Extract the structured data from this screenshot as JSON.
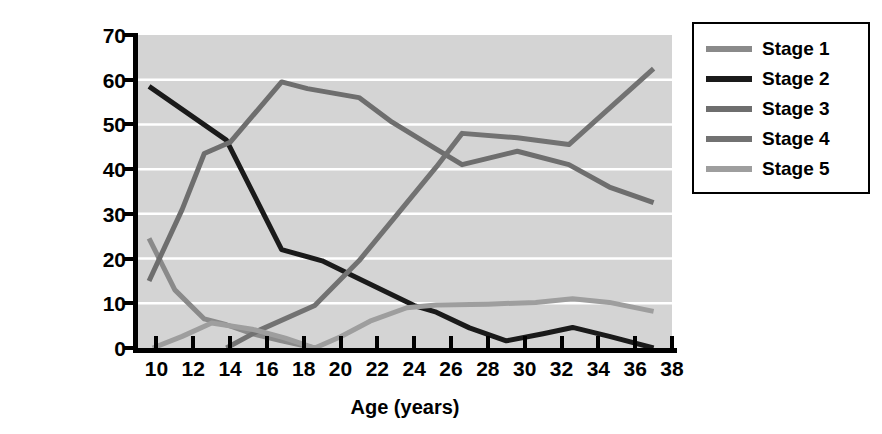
{
  "chart_data": {
    "type": "line",
    "title": "",
    "xlabel": "Age (years)",
    "ylabel_line1": "Percentage at each stage",
    "ylabel_line2": "of moral reasoning",
    "xlim": [
      9,
      38
    ],
    "ylim": [
      0,
      70
    ],
    "xticks": [
      10,
      12,
      14,
      16,
      18,
      20,
      22,
      24,
      26,
      28,
      30,
      32,
      34,
      36,
      38
    ],
    "yticks": [
      0,
      10,
      20,
      30,
      40,
      50,
      60,
      70
    ],
    "grid": "horizontal",
    "gridcolor": "#ffffff",
    "plot_background": "#d4d4d4",
    "legend_position": "right-outside",
    "series": [
      {
        "name": "Stage 1",
        "color": "#8a8a8a",
        "x": [
          9.6,
          11.0,
          12.6,
          13.8,
          15.2,
          16.8,
          18.6
        ],
        "values": [
          24.5,
          13.0,
          6.5,
          5.2,
          3.2,
          1.6,
          0.0
        ]
      },
      {
        "name": "Stage 2",
        "color": "#1a1a1a",
        "x": [
          9.6,
          13.8,
          16.8,
          19.0,
          21.0,
          24.0,
          25.2,
          27.0,
          29.0,
          31.0,
          32.6,
          34.6,
          37.0
        ],
        "values": [
          58.5,
          46.5,
          22.0,
          19.5,
          15.5,
          9.5,
          8.0,
          4.5,
          1.6,
          3.2,
          4.6,
          2.6,
          0.0
        ]
      },
      {
        "name": "Stage 3",
        "color": "#6e6e6e",
        "x": [
          9.6,
          11.4,
          12.6,
          14.0,
          16.8,
          18.2,
          21.0,
          22.8,
          25.2,
          26.6,
          29.6,
          32.4,
          34.6,
          37.0
        ],
        "values": [
          15.0,
          31.0,
          43.5,
          46.0,
          59.5,
          58.0,
          56.0,
          50.5,
          44.5,
          41.0,
          44.0,
          41.0,
          36.0,
          32.5
        ]
      },
      {
        "name": "Stage 4",
        "color": "#727272",
        "x": [
          13.8,
          15.6,
          18.6,
          21.0,
          22.8,
          25.2,
          26.6,
          29.6,
          32.4,
          37.0
        ],
        "values": [
          0.0,
          4.0,
          9.5,
          19.5,
          28.5,
          40.5,
          48.0,
          47.0,
          45.5,
          62.5
        ]
      },
      {
        "name": "Stage 5",
        "color": "#9e9e9e",
        "x": [
          9.8,
          11.4,
          13.0,
          15.2,
          17.0,
          18.6,
          20.0,
          21.6,
          23.6,
          25.2,
          28.0,
          30.6,
          32.6,
          34.6,
          37.0
        ],
        "values": [
          0.0,
          2.6,
          5.6,
          4.2,
          2.2,
          0.0,
          2.5,
          6.0,
          9.0,
          9.6,
          9.8,
          10.2,
          11.0,
          10.2,
          8.2
        ]
      }
    ]
  },
  "legend": {
    "items": [
      {
        "label": "Stage 1",
        "color": "#8a8a8a"
      },
      {
        "label": "Stage 2",
        "color": "#1a1a1a"
      },
      {
        "label": "Stage 3",
        "color": "#6e6e6e"
      },
      {
        "label": "Stage 4",
        "color": "#727272"
      },
      {
        "label": "Stage 5",
        "color": "#9e9e9e"
      }
    ]
  }
}
